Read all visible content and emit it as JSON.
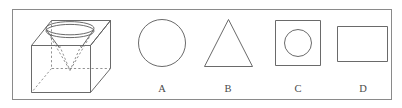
{
  "figure": {
    "name": "geometry-multiple-choice-figure",
    "border_color": "#8a8a8a",
    "line_color": "#595959",
    "dashed_line_color": "#7d7d7d",
    "background_color": "#ffffff"
  },
  "stimulus": {
    "name": "cube-with-inverted-cone",
    "solid_label": "cube",
    "inner_solid_label": "inverted cone",
    "cone_rim": "ellipse",
    "hidden_edges_style": "dashed"
  },
  "options": [
    {
      "label": "A",
      "shape": "circle"
    },
    {
      "label": "B",
      "shape": "triangle"
    },
    {
      "label": "C",
      "shape": "square-with-inner-circle"
    },
    {
      "label": "D",
      "shape": "rectangle"
    }
  ]
}
